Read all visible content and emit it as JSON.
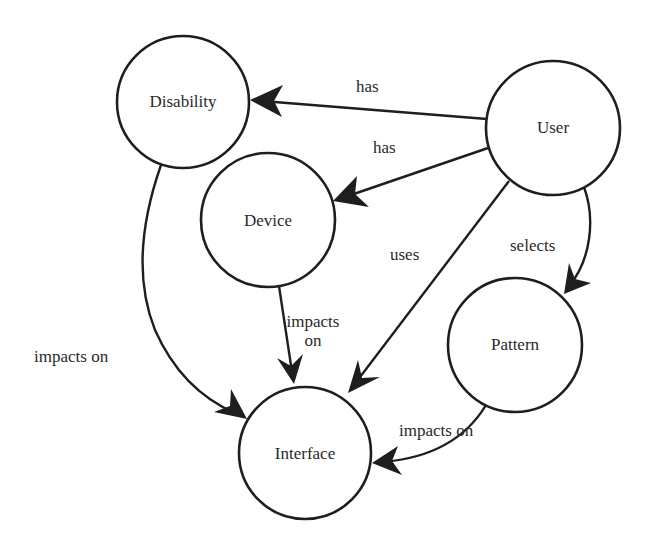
{
  "diagram": {
    "nodes": [
      {
        "id": "disability",
        "label": "Disability",
        "cx": 183,
        "cy": 102,
        "r": 66
      },
      {
        "id": "user",
        "label": "User",
        "cx": 553,
        "cy": 128,
        "r": 67
      },
      {
        "id": "device",
        "label": "Device",
        "cx": 268,
        "cy": 220,
        "r": 67
      },
      {
        "id": "pattern",
        "label": "Pattern",
        "cx": 515,
        "cy": 345,
        "r": 67
      },
      {
        "id": "interface",
        "label": "Interface",
        "cx": 305,
        "cy": 453,
        "r": 66
      }
    ],
    "edges": [
      {
        "from": "user",
        "to": "disability",
        "label": "has"
      },
      {
        "from": "user",
        "to": "device",
        "label": "has"
      },
      {
        "from": "user",
        "to": "interface",
        "label": "uses"
      },
      {
        "from": "user",
        "to": "pattern",
        "label": "selects"
      },
      {
        "from": "disability",
        "to": "interface",
        "label": "impacts on"
      },
      {
        "from": "device",
        "to": "interface",
        "label_line1": "impacts",
        "label_line2": "on"
      },
      {
        "from": "pattern",
        "to": "interface",
        "label": "impacts on"
      }
    ]
  }
}
